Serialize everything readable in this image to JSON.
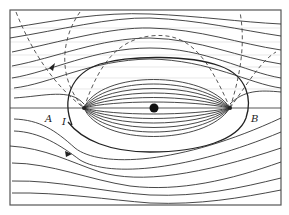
{
  "figure": {
    "type": "flow field / streamline diagram",
    "labels": {
      "left_point": "A",
      "right_point": "B",
      "separatrix": "I"
    },
    "elements": {
      "central_body": "filled circle at center",
      "stagnation_points": [
        "left cusp on axis",
        "right cusp on axis"
      ],
      "dashed_curves": 4,
      "direction_arrows": 2
    },
    "colors": {
      "lines": "#333333",
      "background": "#ffffff",
      "frame": "#555555"
    }
  }
}
